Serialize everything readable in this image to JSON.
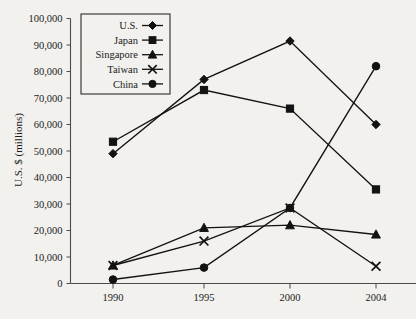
{
  "chart_data": {
    "type": "line",
    "title": "",
    "xlabel": "",
    "ylabel": "U.S. $ (millions)",
    "categories": [
      "1990",
      "1995",
      "2000",
      "2004"
    ],
    "x": [
      1990,
      1995,
      2000,
      2004
    ],
    "xlim": [
      1990,
      2004
    ],
    "ylim": [
      0,
      100000
    ],
    "ytick_labels": [
      "100,000",
      "90,000",
      "80,000",
      "70,000",
      "60,000",
      "50,000",
      "40,000",
      "30,000",
      "20,000",
      "10,000",
      "0"
    ],
    "ytick_values": [
      100000,
      90000,
      80000,
      70000,
      60000,
      50000,
      40000,
      30000,
      20000,
      10000,
      0
    ],
    "xtick_labels": [
      "1990",
      "1995",
      "2000",
      "2004"
    ],
    "grid": false,
    "legend_position": "top-left-inside",
    "series": [
      {
        "name": "U.S.",
        "marker": "diamond",
        "values": [
          49000,
          77000,
          91500,
          60000
        ]
      },
      {
        "name": "Japan",
        "marker": "square",
        "values": [
          53500,
          73000,
          66000,
          35500
        ]
      },
      {
        "name": "Singapore",
        "marker": "triangle",
        "values": [
          6800,
          21000,
          22000,
          18500
        ]
      },
      {
        "name": "Taiwan",
        "marker": "x",
        "values": [
          6800,
          16000,
          28500,
          6500
        ]
      },
      {
        "name": "China",
        "marker": "circle",
        "values": [
          1500,
          6000,
          28500,
          82000
        ]
      }
    ]
  },
  "legend": {
    "entries": [
      {
        "label": "U.S.",
        "marker": "diamond"
      },
      {
        "label": "Japan",
        "marker": "square"
      },
      {
        "label": "Singapore",
        "marker": "triangle"
      },
      {
        "label": "Taiwan",
        "marker": "x"
      },
      {
        "label": "China",
        "marker": "circle"
      }
    ]
  },
  "colors": {
    "background": "#f2f1ee",
    "ink": "#121212",
    "axis": "#4a4a4a"
  }
}
